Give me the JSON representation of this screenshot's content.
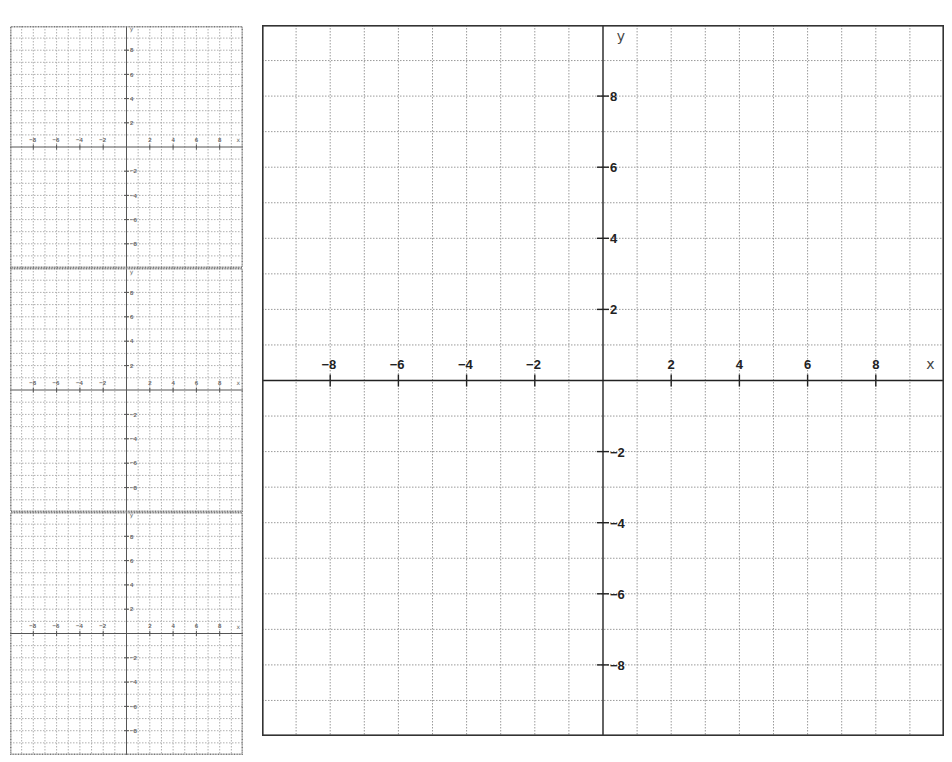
{
  "page": {
    "width": 952,
    "height": 762,
    "background": "#ffffff"
  },
  "grids": {
    "large": {
      "x": 262,
      "y": 25,
      "width": 682,
      "height": 711,
      "xmin": -10,
      "xmax": 10,
      "ymin": -10,
      "ymax": 10,
      "grid_step": 1,
      "tick_step": 2,
      "x_axis_label": "x",
      "y_axis_label": "y",
      "x_tick_labels": [
        "-8",
        "-6",
        "-4",
        "-2",
        "2",
        "4",
        "6",
        "8"
      ],
      "y_tick_labels": [
        "8",
        "6",
        "4",
        "2",
        "-2",
        "-4",
        "-6",
        "-8"
      ]
    },
    "small": [
      {
        "x": 10,
        "y": 26,
        "width": 233,
        "height": 242,
        "xmin": -10,
        "xmax": 10,
        "ymin": -10,
        "ymax": 10,
        "x_axis_label": "x",
        "y_axis_label": "y"
      },
      {
        "x": 10,
        "y": 268,
        "width": 233,
        "height": 244,
        "xmin": -10,
        "xmax": 10,
        "ymin": -10,
        "ymax": 10,
        "x_axis_label": "x",
        "y_axis_label": "y"
      },
      {
        "x": 10,
        "y": 512,
        "width": 233,
        "height": 243,
        "xmin": -10,
        "xmax": 10,
        "ymin": -10,
        "ymax": 10,
        "x_axis_label": "x",
        "y_axis_label": "y"
      }
    ]
  },
  "chart_data": {
    "type": "coordinate-grid",
    "title": "",
    "panels": [
      {
        "name": "large coordinate plane",
        "xlim": [
          -10,
          10
        ],
        "ylim": [
          -10,
          10
        ],
        "xlabel": "x",
        "ylabel": "y",
        "x_ticks": [
          -8,
          -6,
          -4,
          -2,
          2,
          4,
          6,
          8
        ],
        "y_ticks": [
          -8,
          -6,
          -4,
          -2,
          2,
          4,
          6,
          8
        ],
        "grid": true,
        "grid_step": 1
      },
      {
        "name": "small coordinate plane 1",
        "xlim": [
          -10,
          10
        ],
        "ylim": [
          -10,
          10
        ],
        "xlabel": "x",
        "ylabel": "y",
        "x_ticks": [
          -8,
          -6,
          -4,
          -2,
          2,
          4,
          6,
          8
        ],
        "y_ticks": [
          -8,
          -6,
          -4,
          -2,
          2,
          4,
          6,
          8
        ],
        "grid": true,
        "grid_step": 1
      },
      {
        "name": "small coordinate plane 2",
        "xlim": [
          -10,
          10
        ],
        "ylim": [
          -10,
          10
        ],
        "xlabel": "x",
        "ylabel": "y",
        "x_ticks": [
          -8,
          -6,
          -4,
          -2,
          2,
          4,
          6,
          8
        ],
        "y_ticks": [
          -8,
          -6,
          -4,
          -2,
          2,
          4,
          6,
          8
        ],
        "grid": true,
        "grid_step": 1
      },
      {
        "name": "small coordinate plane 3",
        "xlim": [
          -10,
          10
        ],
        "ylim": [
          -10,
          10
        ],
        "xlabel": "x",
        "ylabel": "y",
        "x_ticks": [
          -8,
          -6,
          -4,
          -2,
          2,
          4,
          6,
          8
        ],
        "y_ticks": [
          -8,
          -6,
          -4,
          -2,
          2,
          4,
          6,
          8
        ],
        "grid": true,
        "grid_step": 1
      }
    ],
    "series": []
  }
}
